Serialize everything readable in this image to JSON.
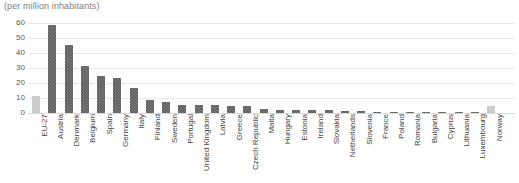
{
  "chart_data": {
    "type": "bar",
    "title": "(per million inhabitants)",
    "subtitle": "",
    "xlabel": "",
    "ylabel": "",
    "ylim": [
      0,
      60
    ],
    "yticks": [
      0,
      10,
      20,
      30,
      40,
      50,
      60
    ],
    "grid": true,
    "legend": "none",
    "categories": [
      "EU-27",
      "Austria",
      "Denmark",
      "Belgium",
      "Spain",
      "Germany",
      "Italy",
      "Finland",
      "Sweden",
      "Portugal",
      "United Kingdom",
      "Latvia",
      "Greece",
      "Czech Republic",
      "Malta",
      "Hungary",
      "Estonia",
      "Ireland",
      "Slovakia",
      "Netherlands",
      "Slovenia",
      "France",
      "Poland",
      "Romania",
      "Bulgaria",
      "Cyprus",
      "Lithuania",
      "Luxembourg",
      "Norway"
    ],
    "values": [
      11.3,
      58.6,
      45.2,
      31.5,
      24.5,
      23.5,
      17.0,
      9.0,
      7.5,
      5.5,
      5.2,
      5.1,
      5.0,
      4.4,
      2.4,
      2.2,
      2.0,
      1.9,
      1.7,
      1.4,
      1.2,
      1.0,
      0.9,
      0.8,
      0.7,
      0.6,
      0.5,
      0.4,
      5.0
    ],
    "bar_styles": [
      "light",
      "dark",
      "dark",
      "dark",
      "dark",
      "dark",
      "dark",
      "dark",
      "dark",
      "dark",
      "dark",
      "dark",
      "dark",
      "dark",
      "dark",
      "dark",
      "dark",
      "dark",
      "dark",
      "dark",
      "dark",
      "dark",
      "dark",
      "dark",
      "dark",
      "dark",
      "dark",
      "dark",
      "light"
    ],
    "colors": {
      "bar_dark": "#595959",
      "bar_light": "#c6c6c6",
      "gridline": "#e8e8e8",
      "baseline": "#d9d9d9",
      "tick_label": "#595959",
      "category_label": "#3f3f3f",
      "title": "#808080",
      "background": "#ffffff"
    }
  }
}
